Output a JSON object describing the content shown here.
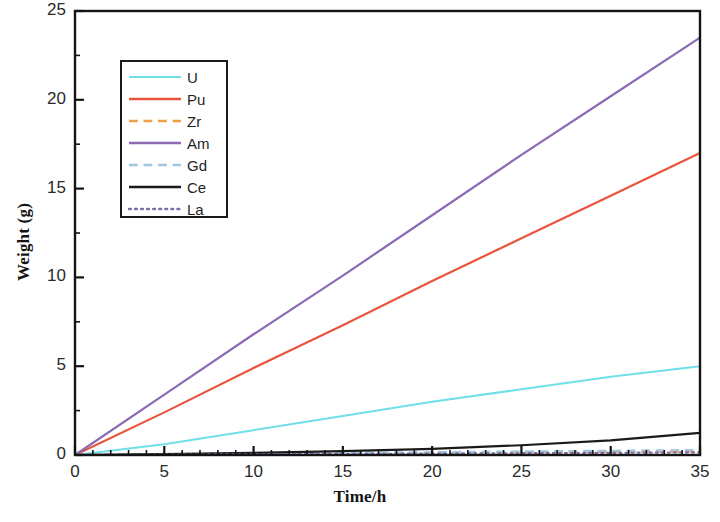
{
  "chart_data": {
    "type": "line",
    "title": "",
    "xlabel": "Time/h",
    "ylabel": "Weight (g)",
    "xlim": [
      0,
      35
    ],
    "ylim": [
      0,
      25
    ],
    "xticks": [
      0,
      5,
      10,
      15,
      20,
      25,
      30,
      35
    ],
    "xtick_labels": [
      "0",
      "5",
      "10",
      "15",
      "20",
      "25",
      "30",
      "35"
    ],
    "yticks": [
      0,
      5,
      10,
      15,
      20,
      25
    ],
    "ytick_labels": [
      "0",
      "5",
      "10",
      "15",
      "20",
      "25"
    ],
    "x_minor_tick_step": 1,
    "y_minor_tick_step": 2.5,
    "grid": false,
    "legend_position": "upper-left-inside",
    "frame": true,
    "x": [
      0,
      5,
      10,
      15,
      20,
      25,
      30,
      35
    ],
    "series": [
      {
        "name": "U",
        "color": "#6FE0E8",
        "style": "solid",
        "width": 2.0,
        "values": [
          0,
          0.6,
          1.4,
          2.2,
          3.0,
          3.7,
          4.4,
          5.0
        ]
      },
      {
        "name": "Pu",
        "color": "#E8553C",
        "style": "solid",
        "width": 2.2,
        "values": [
          0,
          2.4,
          4.9,
          7.3,
          9.8,
          12.2,
          14.6,
          17.0
        ]
      },
      {
        "name": "Zr",
        "color": "#F0A04B",
        "style": "dashed",
        "width": 2.2,
        "values": [
          0,
          0.03,
          0.06,
          0.09,
          0.12,
          0.15,
          0.18,
          0.2
        ]
      },
      {
        "name": "Am",
        "color": "#8B6BB5",
        "style": "solid",
        "width": 2.2,
        "values": [
          0,
          3.4,
          6.8,
          10.1,
          13.5,
          16.9,
          20.2,
          23.5
        ]
      },
      {
        "name": "Gd",
        "color": "#9FC8DF",
        "style": "dashed",
        "width": 2.2,
        "values": [
          0,
          0.04,
          0.08,
          0.12,
          0.16,
          0.2,
          0.24,
          0.28
        ]
      },
      {
        "name": "Ce",
        "color": "#1a1a1a",
        "style": "solid",
        "width": 2.2,
        "values": [
          0,
          0.05,
          0.12,
          0.22,
          0.35,
          0.55,
          0.82,
          1.25
        ]
      },
      {
        "name": "La",
        "color": "#7B6FAE",
        "style": "dotted",
        "width": 2.2,
        "values": [
          0,
          0.02,
          0.04,
          0.06,
          0.08,
          0.1,
          0.12,
          0.15
        ]
      }
    ]
  },
  "legend": {
    "entries": [
      "U",
      "Pu",
      "Zr",
      "Am",
      "Gd",
      "Ce",
      "La"
    ]
  }
}
